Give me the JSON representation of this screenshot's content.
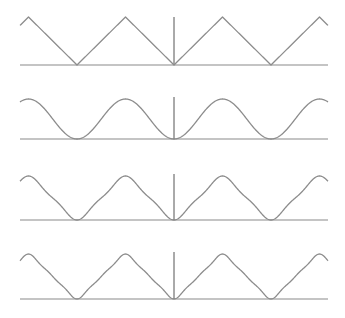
{
  "chart_data": {
    "type": "line",
    "title": "",
    "x_range_half_periods": [
      -3.18,
      3.18
    ],
    "grid": false,
    "legend": null,
    "panels": [
      {
        "name": "triangle-wave",
        "harmonics": "exact",
        "baseline_y": 65,
        "peak_y": 17,
        "axis_top_y": 17
      },
      {
        "name": "fourier-1-term",
        "harmonics": [
          1
        ],
        "baseline_y": 139,
        "peak_y": 99,
        "axis_top_y": 97
      },
      {
        "name": "fourier-2-terms",
        "harmonics": [
          1,
          3
        ],
        "baseline_y": 220,
        "peak_y": 176,
        "axis_top_y": 174
      },
      {
        "name": "fourier-3-terms",
        "harmonics": [
          1,
          3,
          5
        ],
        "baseline_y": 299,
        "peak_y": 254,
        "axis_top_y": 252
      }
    ]
  },
  "layout": {
    "x_left": 20,
    "x_right": 328,
    "x_center": 174,
    "half_period_px": 48.5
  },
  "colors": {
    "curve": "#8c8c8c",
    "baseline": "#8a8a8a",
    "axis": "#555555",
    "background": "#ffffff"
  }
}
